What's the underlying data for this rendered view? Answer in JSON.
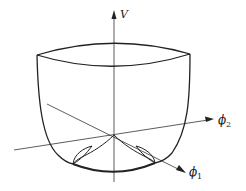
{
  "figure": {
    "type": "3D potential surface (Mexican-hat / double-well bowl)",
    "axes": {
      "vertical": {
        "label": "V"
      },
      "axis1": {
        "label": "ϕ",
        "subscript": "1"
      },
      "axis2": {
        "label": "ϕ",
        "subscript": "2"
      }
    },
    "colors": {
      "line": "#222222",
      "background": "#ffffff"
    }
  }
}
